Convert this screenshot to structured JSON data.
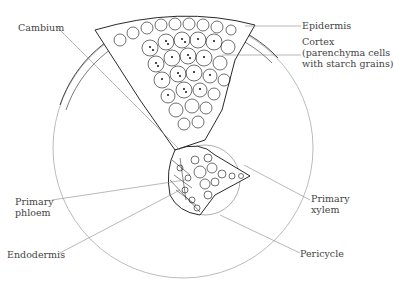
{
  "diagram": {
    "labels": {
      "cambium": "Cambium",
      "epidermis": "Epidermis",
      "cortex_line1": "Cortex",
      "cortex_line2": "(parenchyma cells",
      "cortex_line3": "with starch grains)",
      "primary_phloem_line1": "Primary",
      "primary_phloem_line2": "phloem",
      "endodermis": "Endodermis",
      "primary_xylem_line1": "Primary",
      "primary_xylem_line2": "xylem",
      "pericycle": "Pericycle"
    },
    "colors": {
      "outline": "#999999",
      "cells": "#111111",
      "text": "#444444"
    }
  }
}
